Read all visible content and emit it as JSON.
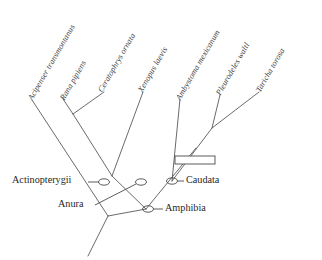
{
  "figure": {
    "type": "phylogenetic-tree-cladogram",
    "background_color": "#ffffff",
    "line_color": "#595959",
    "text_color": "#1f1f1f",
    "width": 322,
    "height": 260
  },
  "taxa": [
    {
      "id": "acipenser",
      "name": "Acipenser transmontanus",
      "x": 30,
      "y": 95,
      "angle": -60
    },
    {
      "id": "rana",
      "name": "Rana pipiens",
      "x": 62,
      "y": 95,
      "angle": -60
    },
    {
      "id": "ceratophrys",
      "name": "Ceratophrys ornata",
      "x": 100,
      "y": 87,
      "angle": -60
    },
    {
      "id": "xenopus",
      "name": "Xenopus laevis",
      "x": 140,
      "y": 87,
      "angle": -60
    },
    {
      "id": "ambystoma",
      "name": "Ambystoma mexicanum",
      "x": 178,
      "y": 95,
      "angle": -60
    },
    {
      "id": "pleurodeles",
      "name": "Pleurodeles waltl",
      "x": 218,
      "y": 90,
      "angle": -60
    },
    {
      "id": "taricha",
      "name": "Taricha torosa",
      "x": 258,
      "y": 87,
      "angle": -60
    }
  ],
  "clades": [
    {
      "id": "actinopterygii",
      "label": "Actinopterygii",
      "label_x": 12,
      "label_y": 174
    },
    {
      "id": "anura",
      "label": "Anura",
      "label_x": 58,
      "label_y": 203
    },
    {
      "id": "caudata",
      "label": "Caudata",
      "label_x": 186,
      "label_y": 174
    },
    {
      "id": "amphibia",
      "label": "Amphibia",
      "label_x": 165,
      "label_y": 203
    }
  ],
  "markers": {
    "node_ellipse_rx": 5.5,
    "node_ellipse_ry": 3.2,
    "state_box": {
      "label": "character-state-box",
      "x": 175,
      "y": 156,
      "width": 40,
      "height": 8
    }
  },
  "nodes": {
    "root": {
      "x": 108,
      "y": 216
    },
    "root_base": {
      "x": 88,
      "y": 256
    },
    "amphibia": {
      "x": 146,
      "y": 209
    },
    "anura": {
      "x": 112,
      "y": 176
    },
    "rana_cerato": {
      "x": 73,
      "y": 114
    },
    "caudata": {
      "x": 172,
      "y": 181
    },
    "pleuro_taricha": {
      "x": 212,
      "y": 128
    }
  }
}
